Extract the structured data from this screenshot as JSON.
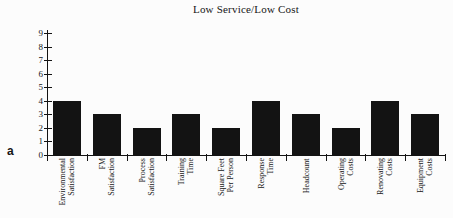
{
  "figure_label": "a",
  "chart_data": {
    "type": "bar",
    "title": "Low Service/Low Cost",
    "categories": [
      "Environmental Satisfaction",
      "FM Satisfaction",
      "Process Satisfaction",
      "Training Time",
      "Square Feet Per Person",
      "Response Time",
      "Headcount",
      "Operating Costs",
      "Renovating Costs",
      "Equipment Costs"
    ],
    "category_lines": [
      [
        "Environmental",
        "Satisfaction"
      ],
      [
        "FM",
        "Satisfaction"
      ],
      [
        "Process",
        "Satisfaction"
      ],
      [
        "Training",
        "Time"
      ],
      [
        "Square Feet",
        "Per Person"
      ],
      [
        "Response",
        "Time"
      ],
      [
        "Headcount"
      ],
      [
        "Operating",
        "Costs"
      ],
      [
        "Renovating",
        "Costs"
      ],
      [
        "Equipment",
        "Costs"
      ]
    ],
    "values": [
      4,
      3,
      2,
      3,
      2,
      4,
      3,
      2,
      4,
      3
    ],
    "ylim": [
      0,
      9
    ],
    "yticks": [
      0,
      1,
      2,
      3,
      4,
      5,
      6,
      7,
      8,
      9
    ],
    "xlabel": "",
    "ylabel": "",
    "grid": false,
    "legend": null,
    "bar_color": "#131313",
    "axis_color": "#131313",
    "text_color": "#161616",
    "background": "#fcfcfc"
  }
}
